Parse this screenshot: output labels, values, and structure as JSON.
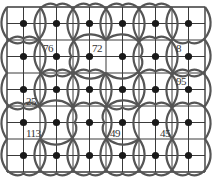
{
  "figure": {
    "grid": {
      "cols": 12,
      "rows": 10,
      "x0": 7,
      "y0": 7,
      "cell": 16.5,
      "line_color": "#3a3a3a",
      "frame_color": "#333333"
    },
    "dots": {
      "cols": 6,
      "rows": 5,
      "color": "#1a1a1a"
    },
    "loop_color": "#555555",
    "labels": [
      {
        "text": "76",
        "x": 43,
        "y": 43
      },
      {
        "text": "72",
        "x": 92,
        "y": 43
      },
      {
        "text": "8",
        "x": 176,
        "y": 43
      },
      {
        "text": "95",
        "x": 176,
        "y": 76
      },
      {
        "text": "25",
        "x": 26,
        "y": 96
      },
      {
        "text": "113",
        "x": 26,
        "y": 128
      },
      {
        "text": "49",
        "x": 110,
        "y": 128
      },
      {
        "text": "45",
        "x": 160,
        "y": 128
      }
    ],
    "lobes": [
      [
        "d",
        "u",
        "u",
        "u",
        "u",
        "d"
      ],
      [
        "u",
        "d",
        "l",
        "r",
        "u",
        "d"
      ],
      [
        "d",
        "u",
        "u",
        "d",
        "u",
        "u"
      ],
      [
        "u",
        "r",
        "u",
        "l",
        "u",
        "u"
      ],
      [
        "d",
        "d",
        "d",
        "d",
        "d",
        "d"
      ]
    ]
  }
}
